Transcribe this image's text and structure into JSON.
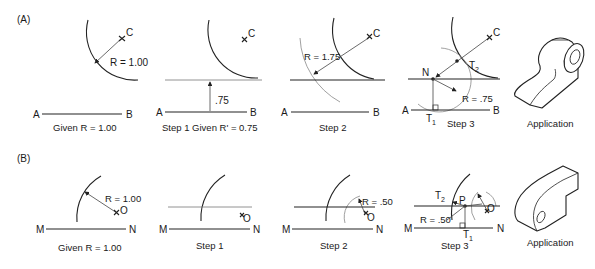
{
  "panels": {
    "A": {
      "label": "(A)",
      "given": {
        "center": "C",
        "radius_label": "R = 1.00",
        "line_start": "A",
        "line_end": "B",
        "caption": "Given R = 1.00"
      },
      "step1": {
        "center": "C",
        "offset_label": ".75",
        "line_start": "A",
        "line_end": "B",
        "caption": "Step 1   Given R' = 0.75"
      },
      "step2": {
        "center": "C",
        "radius_label": "R = 1.75",
        "line_start": "A",
        "line_end": "B",
        "caption": "Step 2"
      },
      "step3": {
        "center": "C",
        "point": "N",
        "tangent2": "T",
        "tangent2_sub": "2",
        "tangent1": "T",
        "tangent1_sub": "1",
        "radius_label": "R = .75",
        "line_start": "A",
        "line_end": "B",
        "caption": "Step 3"
      },
      "application": {
        "caption": "Application"
      }
    },
    "B": {
      "label": "(B)",
      "given": {
        "center": "O",
        "radius_label": "R = 1.00",
        "line_start": "M",
        "line_end": "N",
        "caption": "Given R = 1.00"
      },
      "step1": {
        "center": "O",
        "line_start": "M",
        "line_end": "N",
        "caption": "Step 1"
      },
      "step2": {
        "center": "O",
        "radius_label": "R = .50",
        "line_start": "M",
        "line_end": "N",
        "caption": "Step 2"
      },
      "step3": {
        "center": "O",
        "point": "P",
        "tangent2": "T",
        "tangent2_sub": "2",
        "tangent1": "T",
        "tangent1_sub": "1",
        "radius_label": "R = .50",
        "line_start": "M",
        "line_end": "N",
        "caption": "Step 3"
      },
      "application": {
        "caption": "Application"
      }
    }
  }
}
